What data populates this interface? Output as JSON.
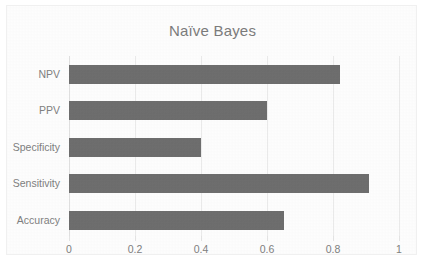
{
  "chart_data": {
    "type": "bar",
    "orientation": "horizontal",
    "title": "Naïve Bayes",
    "xlabel": "",
    "ylabel": "",
    "categories": [
      "Accuracy",
      "Sensitivity",
      "Specificity",
      "PPV",
      "NPV"
    ],
    "values": [
      0.65,
      0.91,
      0.4,
      0.6,
      0.82
    ],
    "xlim": [
      0,
      1
    ],
    "xticks": [
      "0",
      "0.2",
      "0.4",
      "0.6",
      "0.8",
      "1"
    ],
    "xtick_values": [
      0,
      0.2,
      0.4,
      0.6,
      0.8,
      1
    ],
    "grid": true,
    "legend": false,
    "bar_color": "#6e6e6e",
    "text_color": "#808080",
    "gridline_color": "#ebebeb",
    "background_color": "#fdfdfd",
    "border_color": "#f0f0f0"
  }
}
